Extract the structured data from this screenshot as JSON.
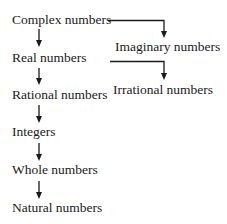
{
  "diagram": {
    "type": "hierarchy",
    "nodes": {
      "complex": "Complex numbers",
      "imaginary": "Imaginary numbers",
      "real": "Real numbers",
      "irrational": "Irrational numbers",
      "rational": "Rational numbers",
      "integers": "Integers",
      "whole": "Whole numbers",
      "natural": "Natural numbers"
    },
    "edges": [
      {
        "from": "Complex numbers",
        "to": "Real numbers"
      },
      {
        "from": "Complex numbers",
        "to": "Imaginary numbers"
      },
      {
        "from": "Real numbers",
        "to": "Rational numbers"
      },
      {
        "from": "Real numbers",
        "to": "Irrational numbers"
      },
      {
        "from": "Rational numbers",
        "to": "Integers"
      },
      {
        "from": "Integers",
        "to": "Whole numbers"
      },
      {
        "from": "Whole numbers",
        "to": "Natural numbers"
      }
    ],
    "colors": {
      "line": "#1a1a1a",
      "background": "#ffffff"
    }
  }
}
